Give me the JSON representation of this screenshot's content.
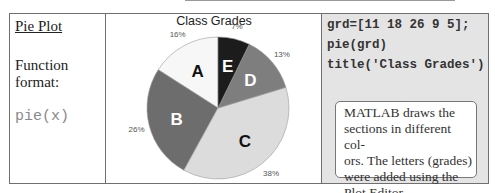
{
  "left_column": {
    "heading": "Pie Plot",
    "format_label_line1": "Function",
    "format_label_line2": "format:",
    "function_syntax": "pie(x)"
  },
  "code_column": {
    "lines": [
      "grd=[11 18 26 9 5];",
      "pie(grd)",
      "title('Class Grades')"
    ],
    "note_lines": [
      "MATLAB draws the",
      "sections in different col-",
      "ors. The letters (grades)",
      "were added using the",
      "Plot Editor."
    ]
  },
  "chart_data": {
    "type": "pie",
    "title": "Class Grades",
    "categories": [
      "A",
      "B",
      "C",
      "D",
      "E"
    ],
    "values": [
      11,
      18,
      26,
      9,
      5
    ],
    "percent_labels": [
      "16%",
      "26%",
      "38%",
      "13%",
      "7%"
    ],
    "colors": [
      "#f7f7f7",
      "#6d6d6d",
      "#dcdcdc",
      "#7e7e7e",
      "#1c1c1c"
    ],
    "slice_label_colors": [
      "#111111",
      "#ffffff",
      "#111111",
      "#ffffff",
      "#ffffff"
    ],
    "legend": "none"
  }
}
